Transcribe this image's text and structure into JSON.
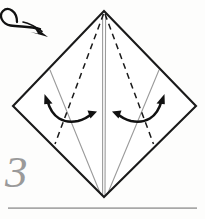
{
  "figure": {
    "step_number": "3",
    "background_color": "#fdfdfc"
  },
  "colors": {
    "outline": "#1a1a1a",
    "crease_dashed": "#1a1a1a",
    "crease_light": "#9b9b9b",
    "arrow": "#111111",
    "step_number": "#9a9a9a",
    "rule": "#a8a8a8"
  },
  "shape": {
    "name": "kite-diamond",
    "vertices": {
      "top": [
        104,
        11
      ],
      "left": [
        13,
        106
      ],
      "bottom": [
        104,
        197
      ],
      "right": [
        196,
        106
      ]
    },
    "outline_width": 2
  },
  "creases": [
    {
      "name": "center-vertical-crease",
      "style": "solid-light",
      "from": [
        103,
        12
      ],
      "to": [
        103,
        196
      ]
    },
    {
      "name": "center-vertical-crease-right",
      "style": "solid-light",
      "from": [
        106,
        12
      ],
      "to": [
        105,
        196
      ]
    },
    {
      "name": "left-existing-crease",
      "style": "solid-light",
      "from": [
        50,
        70
      ],
      "to": [
        100,
        194
      ]
    },
    {
      "name": "right-existing-crease",
      "style": "solid-light",
      "from": [
        159,
        70
      ],
      "to": [
        108,
        194
      ]
    },
    {
      "name": "left-fold-line-dashed",
      "style": "dashed",
      "from": [
        104,
        13
      ],
      "to": [
        55,
        144
      ]
    },
    {
      "name": "right-fold-line-dashed",
      "style": "dashed",
      "from": [
        105,
        13
      ],
      "to": [
        154,
        144
      ]
    }
  ],
  "arrows": [
    {
      "name": "turn-over-arrow",
      "label": "turn model over",
      "position": "top-left",
      "style": "looped"
    },
    {
      "name": "left-fold-arrow",
      "label": "fold flap to center",
      "position": "left-panel",
      "style": "double-headed-curved"
    },
    {
      "name": "right-fold-arrow",
      "label": "fold flap to center",
      "position": "right-panel",
      "style": "double-headed-curved"
    }
  ],
  "footer": {
    "rule_present": true,
    "rule_from_x": 8,
    "rule_to_x": 197,
    "rule_y": 208
  }
}
